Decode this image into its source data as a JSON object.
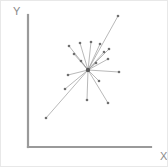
{
  "figure": {
    "title": "",
    "background_color": "#ffffff",
    "border_color": "#e8e8e8",
    "width": 168,
    "height": 167
  },
  "axes": {
    "x_label": "X",
    "y_label": "Y",
    "axis_color": "#9a9a9a",
    "label_color": "#8a8a8a",
    "x_axis": {
      "x1": 27,
      "y1": 146,
      "x2": 150,
      "y2": 146
    },
    "y_axis": {
      "x1": 27,
      "y1": 14,
      "x2": 27,
      "y2": 146
    },
    "x_label_pos": {
      "x": 159,
      "y": 159
    },
    "y_label_pos": {
      "x": 12,
      "y": 14
    },
    "ticks_visible": false,
    "gridlines_visible": false
  },
  "chart_data": {
    "type": "scatter",
    "title": "",
    "subtitle": "",
    "xlabel": "X",
    "ylabel": "Y",
    "xlim": [
      0,
      100
    ],
    "ylim": [
      0,
      100
    ],
    "grid": false,
    "legend": null,
    "series_color": "#9b9b9b",
    "node_color": "#6f6f6f",
    "hub": {
      "label": "center",
      "px": [
        87,
        69
      ],
      "x": 48.8,
      "y": 58.3
    },
    "nodes": [
      {
        "label": "n1",
        "px": [
          117,
          15
        ],
        "x": 73.2,
        "y": 99.2
      },
      {
        "label": "n2",
        "px": [
          108,
          48
        ],
        "x": 65.9,
        "y": 74.2
      },
      {
        "label": "n3",
        "px": [
          107,
          58
        ],
        "x": 65.0,
        "y": 66.7
      },
      {
        "label": "n4",
        "px": [
          118,
          71
        ],
        "x": 74.0,
        "y": 56.8
      },
      {
        "label": "n5",
        "px": [
          99,
          43
        ],
        "x": 58.5,
        "y": 78.0
      },
      {
        "label": "n6",
        "px": [
          90,
          41
        ],
        "x": 51.2,
        "y": 79.5
      },
      {
        "label": "n7",
        "px": [
          79,
          42
        ],
        "x": 42.3,
        "y": 78.8
      },
      {
        "label": "n8",
        "px": [
          68,
          45
        ],
        "x": 33.3,
        "y": 76.5
      },
      {
        "label": "n9",
        "px": [
          73,
          53
        ],
        "x": 37.4,
        "y": 70.5
      },
      {
        "label": "n10",
        "px": [
          67,
          74
        ],
        "x": 32.5,
        "y": 54.5
      },
      {
        "label": "n11",
        "px": [
          45,
          117
        ],
        "x": 14.6,
        "y": 22.0
      },
      {
        "label": "n12",
        "px": [
          64,
          88
        ],
        "x": 30.1,
        "y": 43.9
      },
      {
        "label": "n13",
        "px": [
          86,
          99
        ],
        "x": 48.0,
        "y": 35.6
      },
      {
        "label": "n14",
        "px": [
          98,
          80
        ],
        "x": 57.7,
        "y": 50.0
      },
      {
        "label": "n15",
        "px": [
          107,
          102
        ],
        "x": 65.0,
        "y": 33.3
      },
      {
        "label": "n16",
        "px": [
          103,
          51
        ],
        "x": 61.8,
        "y": 72.0
      },
      {
        "label": "n17",
        "px": [
          95,
          62
        ],
        "x": 55.3,
        "y": 63.6
      },
      {
        "label": "n18",
        "px": [
          80,
          60
        ],
        "x": 43.1,
        "y": 65.2
      }
    ]
  }
}
